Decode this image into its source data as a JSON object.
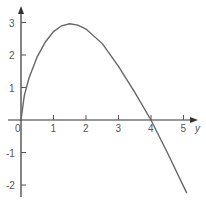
{
  "chart_data": {
    "type": "line",
    "title": "",
    "xlabel": "y",
    "ylabel": "",
    "xlim": [
      0,
      5.4
    ],
    "ylim": [
      -2.4,
      3.4
    ],
    "grid": false,
    "x_ticks": [
      "0",
      "1",
      "2",
      "3",
      "4",
      "5"
    ],
    "y_ticks": [
      "3",
      "2",
      "1",
      "-1",
      "-2"
    ],
    "series": [
      {
        "name": "curve",
        "color": "#666666",
        "x": [
          0,
          0.1,
          0.25,
          0.5,
          0.75,
          1.0,
          1.25,
          1.5,
          1.75,
          2.0,
          2.5,
          3.0,
          3.5,
          4.0,
          4.5,
          5.1
        ],
        "y": [
          0,
          0.75,
          1.3,
          1.95,
          2.4,
          2.72,
          2.9,
          2.96,
          2.92,
          2.8,
          2.35,
          1.65,
          0.85,
          0.0,
          -1.0,
          -2.25
        ]
      }
    ]
  }
}
